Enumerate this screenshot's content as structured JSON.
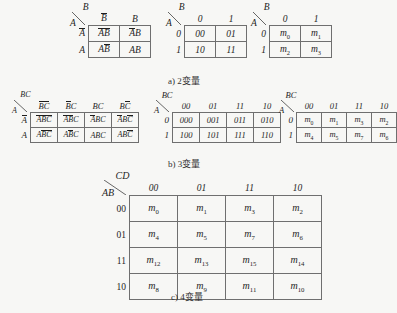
{
  "figure": {
    "background_color": "#f7f7f5",
    "ink_color": "#1e1e1e",
    "grid_color": "#6f6f6f"
  },
  "sections": [
    {
      "id": "two-variable",
      "caption": "a) 2变量",
      "tables": [
        {
          "id": "two-var-algebraic",
          "corner_top": "B",
          "corner_bottom": "A",
          "col_headers": [
            {
              "text": "B",
              "bar": true
            },
            {
              "text": "B",
              "bar": false
            }
          ],
          "row_headers": [
            {
              "text": "A",
              "bar": true
            },
            {
              "text": "A",
              "bar": false
            }
          ],
          "cells": [
            [
              {
                "parts": [
                  {
                    "t": "A",
                    "bar": true
                  },
                  {
                    "t": "B",
                    "bar": true
                  }
                ]
              },
              {
                "parts": [
                  {
                    "t": "A",
                    "bar": true
                  },
                  {
                    "t": "B",
                    "bar": false
                  }
                ]
              }
            ],
            [
              {
                "parts": [
                  {
                    "t": "A",
                    "bar": false
                  },
                  {
                    "t": "B",
                    "bar": true
                  }
                ]
              },
              {
                "parts": [
                  {
                    "t": "A",
                    "bar": false
                  },
                  {
                    "t": "B",
                    "bar": false
                  }
                ]
              }
            ]
          ]
        },
        {
          "id": "two-var-binary",
          "corner_top": "B",
          "corner_bottom": "A",
          "col_headers": [
            {
              "text": "0",
              "bar": false
            },
            {
              "text": "1",
              "bar": false
            }
          ],
          "row_headers": [
            {
              "text": "0",
              "bar": false
            },
            {
              "text": "1",
              "bar": false
            }
          ],
          "cells": [
            [
              {
                "plain": "00"
              },
              {
                "plain": "01"
              }
            ],
            [
              {
                "plain": "10"
              },
              {
                "plain": "11"
              }
            ]
          ]
        },
        {
          "id": "two-var-minterm",
          "corner_top": "B",
          "corner_bottom": "A",
          "col_headers": [
            {
              "text": "0",
              "bar": false
            },
            {
              "text": "1",
              "bar": false
            }
          ],
          "row_headers": [
            {
              "text": "0",
              "bar": false
            },
            {
              "text": "1",
              "bar": false
            }
          ],
          "cells": [
            [
              {
                "m": "0"
              },
              {
                "m": "1"
              }
            ],
            [
              {
                "m": "2"
              },
              {
                "m": "3"
              }
            ]
          ]
        }
      ]
    },
    {
      "id": "three-variable",
      "caption": "b) 3变量",
      "tables": [
        {
          "id": "three-var-algebraic",
          "corner_top": "BC",
          "corner_bottom": "A",
          "col_headers": [
            {
              "parts": [
                {
                  "t": "B",
                  "bar": true
                },
                {
                  "t": "C",
                  "bar": true
                }
              ]
            },
            {
              "parts": [
                {
                  "t": "B",
                  "bar": true
                },
                {
                  "t": "C",
                  "bar": false
                }
              ]
            },
            {
              "parts": [
                {
                  "t": "B",
                  "bar": false
                },
                {
                  "t": "C",
                  "bar": false
                }
              ]
            },
            {
              "parts": [
                {
                  "t": "B",
                  "bar": false
                },
                {
                  "t": "C",
                  "bar": true
                }
              ]
            }
          ],
          "row_headers": [
            {
              "text": "A",
              "bar": true
            },
            {
              "text": "A",
              "bar": false
            }
          ],
          "cells": [
            [
              {
                "parts": [
                  {
                    "t": "A",
                    "bar": true
                  },
                  {
                    "t": "B",
                    "bar": true
                  },
                  {
                    "t": "C",
                    "bar": true
                  }
                ]
              },
              {
                "parts": [
                  {
                    "t": "A",
                    "bar": true
                  },
                  {
                    "t": "B",
                    "bar": true
                  },
                  {
                    "t": "C",
                    "bar": false
                  }
                ]
              },
              {
                "parts": [
                  {
                    "t": "A",
                    "bar": true
                  },
                  {
                    "t": "B",
                    "bar": false
                  },
                  {
                    "t": "C",
                    "bar": false
                  }
                ]
              },
              {
                "parts": [
                  {
                    "t": "A",
                    "bar": true
                  },
                  {
                    "t": "B",
                    "bar": false
                  },
                  {
                    "t": "C",
                    "bar": true
                  }
                ]
              }
            ],
            [
              {
                "parts": [
                  {
                    "t": "A",
                    "bar": false
                  },
                  {
                    "t": "B",
                    "bar": true
                  },
                  {
                    "t": "C",
                    "bar": true
                  }
                ]
              },
              {
                "parts": [
                  {
                    "t": "A",
                    "bar": false
                  },
                  {
                    "t": "B",
                    "bar": true
                  },
                  {
                    "t": "C",
                    "bar": false
                  }
                ]
              },
              {
                "parts": [
                  {
                    "t": "A",
                    "bar": false
                  },
                  {
                    "t": "B",
                    "bar": false
                  },
                  {
                    "t": "C",
                    "bar": false
                  }
                ]
              },
              {
                "parts": [
                  {
                    "t": "A",
                    "bar": false
                  },
                  {
                    "t": "B",
                    "bar": false
                  },
                  {
                    "t": "C",
                    "bar": true
                  }
                ]
              }
            ]
          ]
        },
        {
          "id": "three-var-binary",
          "corner_top": "BC",
          "corner_bottom": "A",
          "col_headers": [
            {
              "plain": "00"
            },
            {
              "plain": "01"
            },
            {
              "plain": "11"
            },
            {
              "plain": "10"
            }
          ],
          "row_headers": [
            {
              "text": "0",
              "bar": false
            },
            {
              "text": "1",
              "bar": false
            }
          ],
          "cells": [
            [
              {
                "plain": "000"
              },
              {
                "plain": "001"
              },
              {
                "plain": "011"
              },
              {
                "plain": "010"
              }
            ],
            [
              {
                "plain": "100"
              },
              {
                "plain": "101"
              },
              {
                "plain": "111"
              },
              {
                "plain": "110"
              }
            ]
          ]
        },
        {
          "id": "three-var-minterm",
          "corner_top": "BC",
          "corner_bottom": "A",
          "col_headers": [
            {
              "plain": "00"
            },
            {
              "plain": "01"
            },
            {
              "plain": "11"
            },
            {
              "plain": "10"
            }
          ],
          "row_headers": [
            {
              "text": "0",
              "bar": false
            },
            {
              "text": "1",
              "bar": false
            }
          ],
          "cells": [
            [
              {
                "m": "0"
              },
              {
                "m": "1"
              },
              {
                "m": "3"
              },
              {
                "m": "2"
              }
            ],
            [
              {
                "m": "4"
              },
              {
                "m": "5"
              },
              {
                "m": "7"
              },
              {
                "m": "6"
              }
            ]
          ]
        }
      ]
    },
    {
      "id": "four-variable",
      "caption": "c) 4变量",
      "tables": [
        {
          "id": "four-var-minterm",
          "corner_top": "CD",
          "corner_bottom": "AB",
          "col_headers": [
            {
              "plain": "00"
            },
            {
              "plain": "01"
            },
            {
              "plain": "11"
            },
            {
              "plain": "10"
            }
          ],
          "row_headers": [
            {
              "plain": "00"
            },
            {
              "plain": "01"
            },
            {
              "plain": "11"
            },
            {
              "plain": "10"
            }
          ],
          "cells": [
            [
              {
                "m": "0"
              },
              {
                "m": "1"
              },
              {
                "m": "3"
              },
              {
                "m": "2"
              }
            ],
            [
              {
                "m": "4"
              },
              {
                "m": "5"
              },
              {
                "m": "7"
              },
              {
                "m": "6"
              }
            ],
            [
              {
                "m": "12"
              },
              {
                "m": "13"
              },
              {
                "m": "15"
              },
              {
                "m": "14"
              }
            ],
            [
              {
                "m": "8"
              },
              {
                "m": "9"
              },
              {
                "m": "11"
              },
              {
                "m": "10"
              }
            ]
          ]
        }
      ]
    }
  ]
}
